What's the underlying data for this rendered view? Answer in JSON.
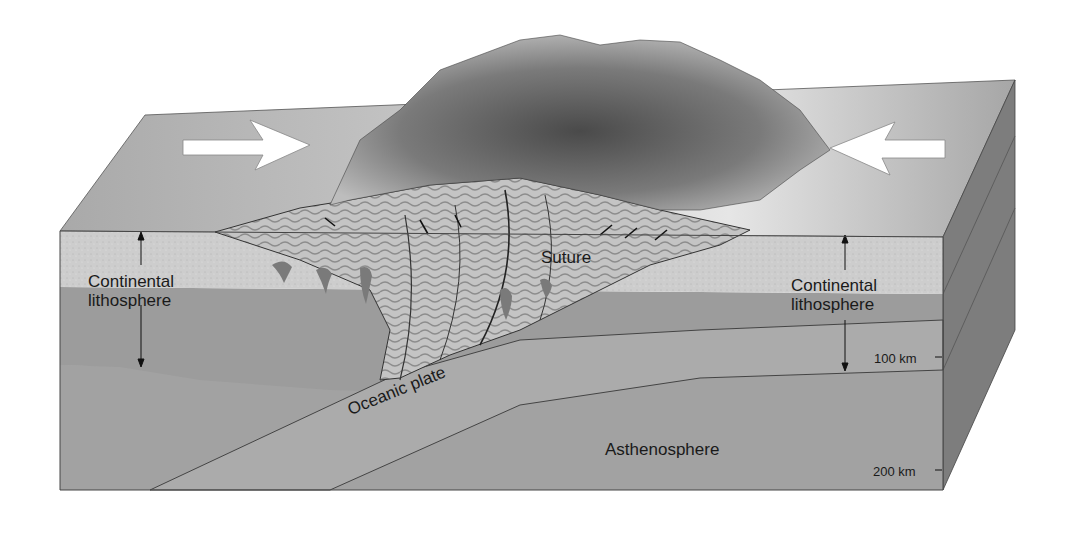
{
  "diagram": {
    "labels": {
      "left_lithosphere": [
        "Continental",
        "lithosphere"
      ],
      "right_lithosphere": [
        "Continental",
        "lithosphere"
      ],
      "suture": "Suture",
      "oceanic_plate": "Oceanic plate",
      "asthenosphere": "Asthenosphere",
      "depth_100": "100 km",
      "depth_200": "200 km"
    },
    "arrows": {
      "left": "arrow-right (plate motion toward boundary)",
      "right": "arrow-left (plate motion toward boundary)"
    },
    "colors": {
      "crust": "#c9c9c9",
      "lithospheric_mantle": "#9c9c9c",
      "asthenosphere": "#a3a3a3",
      "side_face": "#7a7a7a",
      "surface": "#b8b8b8",
      "mountains": "#5e5e5e"
    }
  }
}
